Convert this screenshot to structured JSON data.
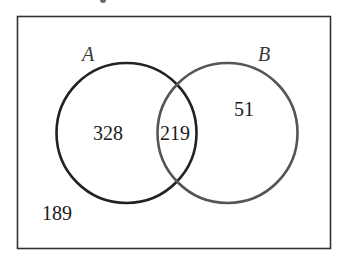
{
  "diagram": {
    "type": "venn",
    "universe": {
      "label": "",
      "outside_count": "189"
    },
    "sets": [
      {
        "name": "A",
        "only_count": "328"
      },
      {
        "name": "B",
        "only_count": "51"
      }
    ],
    "intersection": {
      "sets": [
        "A",
        "B"
      ],
      "count": "219"
    },
    "colors": {
      "border": "#333333",
      "circle_a_stroke": "#222222",
      "circle_b_stroke": "#555555",
      "text": "#1a1a1a",
      "background": "#ffffff"
    }
  }
}
